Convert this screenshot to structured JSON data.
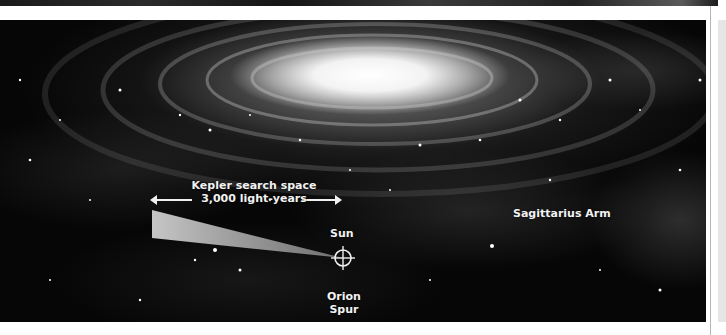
{
  "figure": {
    "labels": {
      "kepler_line1": "Kepler search space",
      "kepler_line2": "3,000 light-years",
      "sun": "Sun",
      "orion_line1": "Orion",
      "orion_line2": "Spur",
      "sagittarius": "Sagittarius Arm"
    },
    "icons": {
      "sun_marker": "crosshair-icon",
      "arrow_left": "arrow-left-icon",
      "arrow_right": "arrow-right-icon"
    },
    "colors": {
      "background": "#060606",
      "label_text": "#f2f2f2",
      "cone_fill": "#bdbdbd",
      "page_background": "#ffffff",
      "side_panel": "#e6e6e6"
    }
  }
}
